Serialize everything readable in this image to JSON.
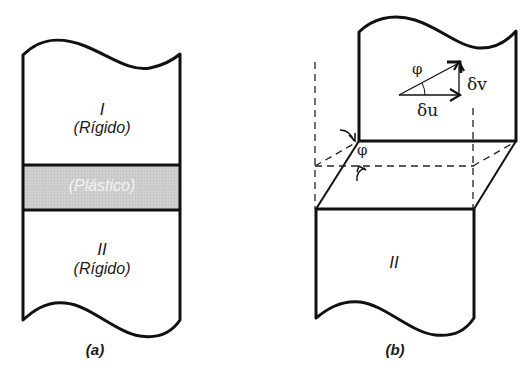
{
  "figure_a": {
    "caption": "(a)",
    "upper_block": {
      "numeral": "I",
      "state": "(Rígido)"
    },
    "band": {
      "state": "(Plástico)",
      "fill": "#c8c8c8"
    },
    "lower_block": {
      "numeral": "II",
      "state": "(Rígido)"
    }
  },
  "figure_b": {
    "caption": "(b)",
    "lower_block": {
      "numeral": "II"
    },
    "vectors": {
      "angle": "φ",
      "delta_u": "δu",
      "delta_v": "δv"
    },
    "shear_angle": "φ"
  },
  "colors": {
    "stroke": "#111111",
    "band_fill": "#c8c8c8",
    "band_text": "#f4f4f4"
  }
}
